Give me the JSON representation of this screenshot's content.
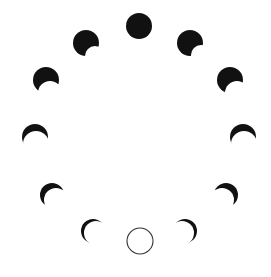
{
  "diagram": {
    "kind": "moon-phases-cycle",
    "arrangement": "circle",
    "background": "#ffffff",
    "ink": "#111111",
    "outline_color": "#333333",
    "phase_count": 11,
    "phases": [
      {
        "id": "top-dark",
        "cx": 139,
        "cy": 26,
        "r": 13,
        "shape": "full-dark"
      },
      {
        "id": "upper-left",
        "cx": 86,
        "cy": 43,
        "r": 13,
        "shape": "dark-with-bite",
        "bite": {
          "dx": 9,
          "dy": 13,
          "r": 10
        }
      },
      {
        "id": "upper-right",
        "cx": 190,
        "cy": 43,
        "r": 13,
        "shape": "dark-with-bite",
        "bite": {
          "dx": 11,
          "dy": 12,
          "r": 10
        }
      },
      {
        "id": "mid-upper-left",
        "cx": 46,
        "cy": 80,
        "r": 13,
        "shape": "dark-with-bite",
        "bite": {
          "dx": 4,
          "dy": 13,
          "r": 12
        }
      },
      {
        "id": "mid-upper-right",
        "cx": 230,
        "cy": 80,
        "r": 13,
        "shape": "dark-with-bite",
        "bite": {
          "dx": 7,
          "dy": 13,
          "r": 12
        }
      },
      {
        "id": "mid-left",
        "cx": 35,
        "cy": 137,
        "r": 13,
        "shape": "crescent",
        "bite": {
          "dx": 1,
          "dy": 7,
          "r": 13
        }
      },
      {
        "id": "mid-right",
        "cx": 243,
        "cy": 137,
        "r": 13,
        "shape": "crescent",
        "bite": {
          "dx": 1,
          "dy": 7,
          "r": 13
        }
      },
      {
        "id": "lower-left",
        "cx": 52,
        "cy": 195,
        "r": 12,
        "shape": "crescent",
        "bite": {
          "dx": 4,
          "dy": 5,
          "r": 12
        }
      },
      {
        "id": "lower-right",
        "cx": 226,
        "cy": 195,
        "r": 12,
        "shape": "crescent",
        "bite": {
          "dx": -4,
          "dy": 5,
          "r": 12
        }
      },
      {
        "id": "bottom-left",
        "cx": 93,
        "cy": 231,
        "r": 12,
        "shape": "crescent",
        "bite": {
          "dx": 3,
          "dy": 2,
          "r": 12
        }
      },
      {
        "id": "bottom-right",
        "cx": 185,
        "cy": 231,
        "r": 12,
        "shape": "crescent",
        "bite": {
          "dx": -3,
          "dy": 2,
          "r": 12
        }
      },
      {
        "id": "bottom-full",
        "cx": 140,
        "cy": 241,
        "r": 13,
        "shape": "outline"
      }
    ]
  }
}
